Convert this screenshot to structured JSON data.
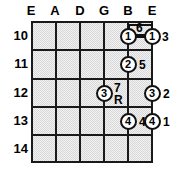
{
  "diagram": {
    "type": "guitar-chord-fretboard",
    "strings": [
      "E",
      "A",
      "D",
      "G",
      "B",
      "E"
    ],
    "frets": [
      "10",
      "11",
      "12",
      "13",
      "14"
    ],
    "colors": {
      "grid_line": "#1a1a1a",
      "board_fill": "#d8d8d8",
      "dot_fill": "#ffffff",
      "text": "#000000"
    },
    "dots": [
      {
        "id": "dot-b-10",
        "finger": "1",
        "string": "B",
        "fret": "10"
      },
      {
        "id": "dot-e-10",
        "finger": "1",
        "string": "E-high",
        "fret": "10"
      },
      {
        "id": "dot-b-11",
        "finger": "2",
        "string": "B",
        "fret": "11"
      },
      {
        "id": "dot-g-12",
        "finger": "3",
        "string": "G",
        "fret": "12"
      },
      {
        "id": "dot-e-12",
        "finger": "3",
        "string": "E-high",
        "fret": "12"
      },
      {
        "id": "dot-b-13",
        "finger": "4",
        "string": "B",
        "fret": "13"
      },
      {
        "id": "dot-e-13",
        "finger": "4",
        "string": "E-high",
        "fret": "13"
      }
    ],
    "annotations": [
      {
        "id": "ann-6",
        "text": "6"
      },
      {
        "id": "ann-3-top",
        "text": "3"
      },
      {
        "id": "ann-5",
        "text": "5"
      },
      {
        "id": "ann-7",
        "text": "7"
      },
      {
        "id": "ann-R",
        "text": "R"
      },
      {
        "id": "ann-2",
        "text": "2"
      },
      {
        "id": "ann-4",
        "text": "4"
      },
      {
        "id": "ann-1",
        "text": "1"
      }
    ],
    "barre": {
      "from_string": "B",
      "to_string": "E-high",
      "fret": "10"
    }
  }
}
